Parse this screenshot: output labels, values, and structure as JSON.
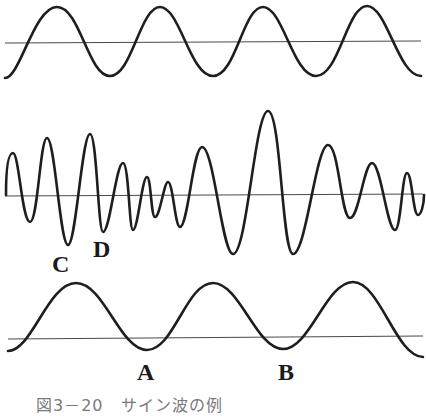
{
  "figure": {
    "caption": "図3－20　サイン波の例",
    "stroke_color": "#1e1e1e",
    "baseline_color": "#4a4a4a",
    "caption_color": "#7a7a7a"
  },
  "waves": [
    {
      "name": "top-sine-wave",
      "baseline_y": 42,
      "description": "Pure sine wave, 4 cycles",
      "peaks_x": [
        57,
        160,
        263,
        367
      ],
      "troughs_x": [
        110,
        213,
        316
      ]
    },
    {
      "name": "complex-wave",
      "baseline_y": 195,
      "description": "Composite (complex) wave with varying amplitude",
      "points": [
        [
          6,
          195
        ],
        [
          13,
          153
        ],
        [
          30,
          222
        ],
        [
          47,
          138
        ],
        [
          68,
          245
        ],
        [
          90,
          134
        ],
        [
          103,
          232
        ],
        [
          123,
          163
        ],
        [
          133,
          230
        ],
        [
          147,
          177
        ],
        [
          155,
          217
        ],
        [
          168,
          182
        ],
        [
          180,
          227
        ],
        [
          202,
          147
        ],
        [
          233,
          254
        ],
        [
          268,
          111
        ],
        [
          293,
          254
        ],
        [
          328,
          145
        ],
        [
          350,
          218
        ],
        [
          372,
          163
        ],
        [
          395,
          230
        ],
        [
          407,
          173
        ],
        [
          418,
          215
        ],
        [
          424,
          195
        ]
      ]
    },
    {
      "name": "bottom-sine-wave",
      "baseline_y": 338,
      "description": "Pure sine wave, lower frequency, 3 cycles",
      "peaks_x": [
        76,
        213,
        353
      ],
      "troughs_x": [
        147,
        283
      ]
    }
  ],
  "labels": {
    "A": "A",
    "B": "B",
    "C": "C",
    "D": "D"
  }
}
